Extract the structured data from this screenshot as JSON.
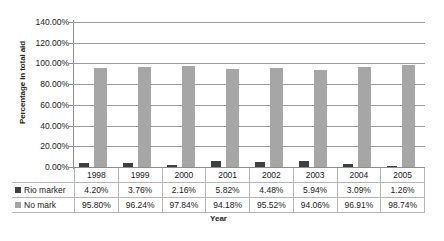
{
  "chart_data": {
    "type": "bar",
    "title": "",
    "xlabel": "Year",
    "ylabel": "Percentage in total aid",
    "categories": [
      "1998",
      "1999",
      "2000",
      "2001",
      "2002",
      "2003",
      "2004",
      "2005"
    ],
    "series": [
      {
        "name": "Rio marker",
        "color": "#3f3f3f",
        "values": [
          4.2,
          3.76,
          2.16,
          5.82,
          4.48,
          5.94,
          3.09,
          1.26
        ],
        "labels": [
          "4.20%",
          "3.76%",
          "2.16%",
          "5.82%",
          "4.48%",
          "5.94%",
          "3.09%",
          "1.26%"
        ]
      },
      {
        "name": "No mark",
        "color": "#a6a6a6",
        "values": [
          95.8,
          96.24,
          97.84,
          94.18,
          95.52,
          94.06,
          96.91,
          98.74
        ],
        "labels": [
          "95.80%",
          "96.24%",
          "97.84%",
          "94.18%",
          "95.52%",
          "94.06%",
          "96.91%",
          "98.74%"
        ]
      }
    ],
    "ylim": [
      0,
      140
    ],
    "yticks": [
      0,
      20,
      40,
      60,
      80,
      100,
      120,
      140
    ],
    "ytick_labels": [
      "0.00%",
      "20.00%",
      "40.00%",
      "60.00%",
      "80.00%",
      "100.00%",
      "120.00%",
      "140.00%"
    ],
    "grid": true,
    "legend_position": "data-table-left",
    "data_table_visible": true
  }
}
